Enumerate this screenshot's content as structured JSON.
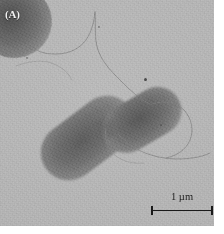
{
  "figure": {
    "type": "transmission-electron-micrograph",
    "panel_label": "(A)",
    "background_color": "#b6b6b6",
    "cell_color": "#6b6b6b",
    "flagella_color": "#7e7e7e",
    "ink_color": "#1a1a1a",
    "label_color": "#f2f2f2"
  },
  "scale_bar": {
    "label": "1 µm",
    "value": "1",
    "unit": "µm",
    "length_px": 62,
    "position": "bottom-right"
  },
  "specimens": [
    {
      "name": "corner-cell",
      "shape": "coccoid",
      "position": "top-left, cropped by frame"
    },
    {
      "name": "lower-rod",
      "shape": "rod",
      "position": "center-left, lower daughter cell"
    },
    {
      "name": "upper-rod",
      "shape": "rod",
      "position": "center-right, upper daughter cell"
    }
  ],
  "features": {
    "flagella_count": 4,
    "septum": "visible constriction between daughter cells",
    "debris_specks": 4
  }
}
